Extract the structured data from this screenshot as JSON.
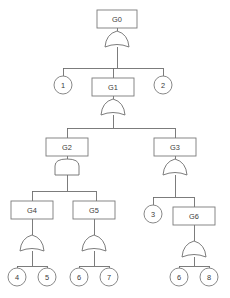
{
  "diagram": {
    "type": "fault-tree",
    "style": {
      "background": "#ffffff",
      "line_color": "#6e6e6e",
      "box_stroke": "#7a7a7a",
      "text_color": "#3a3a3a",
      "fill": "#ffffff"
    },
    "gate_boxes": [
      {
        "id": "G0",
        "label": "G0",
        "x": 100,
        "y": 10,
        "w": 40,
        "h": 18,
        "level": 0
      },
      {
        "id": "G1",
        "label": "G1",
        "x": 92,
        "y": 78,
        "w": 42,
        "h": 18,
        "level": 1
      },
      {
        "id": "G2",
        "label": "G2",
        "x": 46,
        "y": 138,
        "w": 42,
        "h": 18,
        "level": 2
      },
      {
        "id": "G3",
        "label": "G3",
        "x": 154,
        "y": 138,
        "w": 42,
        "h": 18,
        "level": 2
      },
      {
        "id": "G4",
        "label": "G4",
        "x": 32,
        "y": 201,
        "w": 42,
        "h": 18,
        "level": 3
      },
      {
        "id": "G5",
        "label": "G5",
        "x": 96,
        "y": 201,
        "w": 42,
        "h": 18,
        "level": 3
      },
      {
        "id": "G6",
        "label": "G6",
        "x": 194,
        "y": 207,
        "w": 42,
        "h": 18,
        "level": 3
      }
    ],
    "basic_events": [
      {
        "id": "e1",
        "label": "1",
        "x": 63,
        "y": 85,
        "r": 9
      },
      {
        "id": "e2",
        "label": "2",
        "x": 163,
        "y": 85,
        "r": 9
      },
      {
        "id": "e3",
        "label": "3",
        "x": 153,
        "y": 214,
        "r": 9
      },
      {
        "id": "e4",
        "label": "4",
        "x": 17,
        "y": 276,
        "r": 9
      },
      {
        "id": "e5",
        "label": "5",
        "x": 47,
        "y": 276,
        "r": 9
      },
      {
        "id": "e6",
        "label": "6",
        "x": 79,
        "y": 276,
        "r": 9
      },
      {
        "id": "e7",
        "label": "7",
        "x": 109,
        "y": 276,
        "r": 9
      },
      {
        "id": "e8",
        "label": "6",
        "x": 179,
        "y": 276,
        "r": 9
      },
      {
        "id": "e9",
        "label": "8",
        "x": 209,
        "y": 276,
        "r": 9
      }
    ],
    "gates": [
      {
        "id": "gate-G0",
        "kind": "or",
        "parent": "G0",
        "cx": 117,
        "cy": 34,
        "children": [
          "e1",
          "G1",
          "e2"
        ]
      },
      {
        "id": "gate-G1",
        "kind": "or",
        "parent": "G1",
        "cx": 113,
        "cy": 102,
        "children": [
          "G2",
          "G3"
        ]
      },
      {
        "id": "gate-G2",
        "kind": "and",
        "parent": "G2",
        "cx": 67,
        "cy": 162,
        "children": [
          "G4",
          "G5"
        ]
      },
      {
        "id": "gate-G3",
        "kind": "or",
        "parent": "G3",
        "cx": 175,
        "cy": 162,
        "children": [
          "e3",
          "G6"
        ]
      },
      {
        "id": "gate-G4",
        "kind": "or",
        "parent": "G4",
        "cx": 32,
        "cy": 238,
        "children": [
          "e4",
          "e5"
        ]
      },
      {
        "id": "gate-G5",
        "kind": "or",
        "parent": "G5",
        "cx": 94,
        "cy": 238,
        "children": [
          "e6",
          "e7"
        ]
      },
      {
        "id": "gate-G6",
        "kind": "or",
        "parent": "G6",
        "cx": 194,
        "cy": 244,
        "children": [
          "e8",
          "e9"
        ]
      }
    ],
    "labels": {
      "G0": "G0",
      "G1": "G1",
      "G2": "G2",
      "G3": "G3",
      "G4": "G4",
      "G5": "G5",
      "G6": "G6",
      "e1": "1",
      "e2": "2",
      "e3": "3",
      "e4": "4",
      "e5": "5",
      "e6": "6",
      "e7": "7",
      "e8": "6",
      "e9": "8"
    }
  }
}
